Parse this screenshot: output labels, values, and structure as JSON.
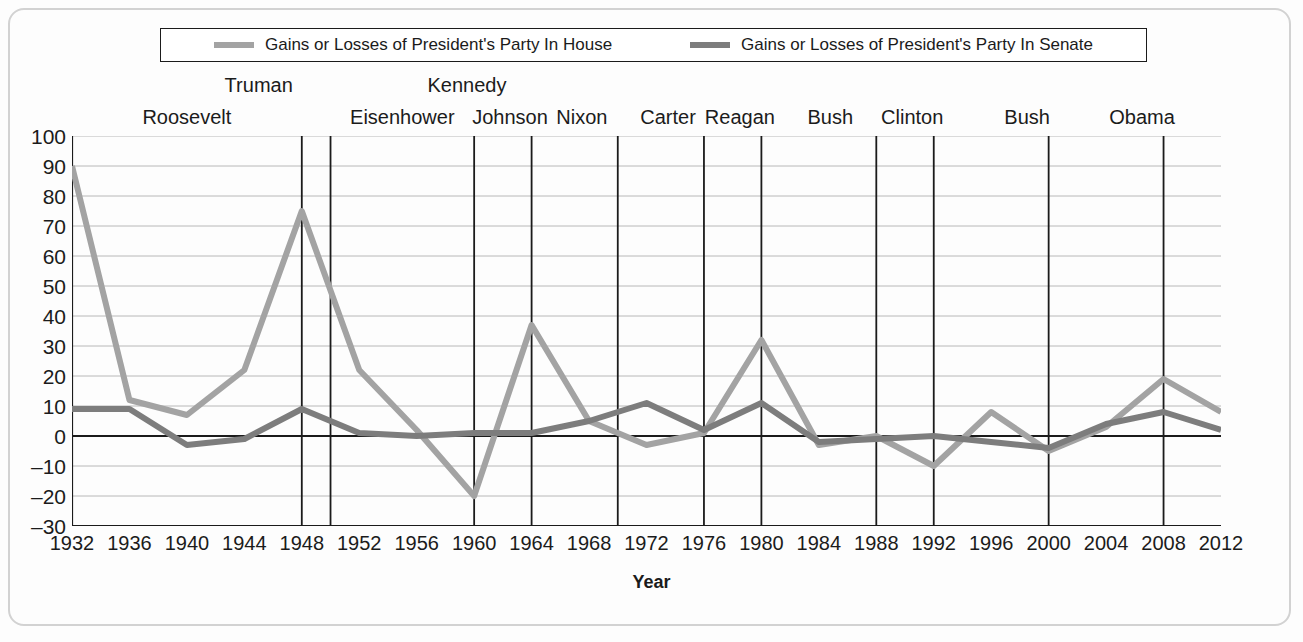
{
  "legend": {
    "entries": [
      {
        "label": "Gains or Losses of President's Party In House",
        "color": "#a3a3a3",
        "series_key": "house"
      },
      {
        "label": "Gains or Losses of President's Party In Senate",
        "color": "#7d7d7d",
        "series_key": "senate"
      }
    ]
  },
  "chart_data": {
    "type": "line",
    "title": "",
    "xlabel": "Year",
    "ylabel": "",
    "grid": true,
    "legend_position": "top",
    "x": [
      1932,
      1936,
      1940,
      1944,
      1948,
      1952,
      1956,
      1960,
      1964,
      1968,
      1972,
      1976,
      1980,
      1984,
      1988,
      1992,
      1996,
      2000,
      2004,
      2008,
      2012
    ],
    "categories": [
      "1932",
      "1936",
      "1940",
      "1944",
      "1948",
      "1952",
      "1956",
      "1960",
      "1964",
      "1968",
      "1972",
      "1976",
      "1980",
      "1984",
      "1988",
      "1992",
      "1996",
      "2000",
      "2004",
      "2008",
      "2012"
    ],
    "xlim": [
      1932,
      2012
    ],
    "ylim": [
      -30,
      100
    ],
    "yticks": [
      100,
      90,
      80,
      70,
      60,
      50,
      40,
      30,
      20,
      10,
      0,
      -10,
      -20,
      -30
    ],
    "ytick_labels": [
      "100",
      "90",
      "80",
      "70",
      "60",
      "50",
      "40",
      "30",
      "20",
      "10",
      "0",
      "–10",
      "–20",
      "–30"
    ],
    "series": [
      {
        "name": "Gains or Losses of President's Party In House",
        "key": "house",
        "color": "#a3a3a3",
        "values": [
          90,
          12,
          7,
          22,
          75,
          22,
          2,
          -20,
          37,
          5,
          -3,
          1,
          32,
          -3,
          0,
          -10,
          8,
          -5,
          3,
          19,
          8
        ]
      },
      {
        "name": "Gains or Losses of President's Party In Senate",
        "key": "senate",
        "color": "#7d7d7d",
        "values": [
          9,
          9,
          -3,
          -1,
          9,
          1,
          0,
          1,
          1,
          5,
          11,
          2,
          11,
          -2,
          -1,
          0,
          -2,
          -4,
          4,
          8,
          2
        ]
      }
    ],
    "annotations": [
      {
        "label": "Roosevelt",
        "year": 1940,
        "row": "lower",
        "divider": null
      },
      {
        "label": "Truman",
        "year": 1945,
        "row": "upper",
        "divider": 1948
      },
      {
        "label": "Eisenhower",
        "year": 1955,
        "row": "lower",
        "divider": 1950
      },
      {
        "label": "Kennedy",
        "year": 1959.5,
        "row": "upper",
        "divider": 1960
      },
      {
        "label": "Johnson",
        "year": 1962.5,
        "row": "lower",
        "divider": 1964
      },
      {
        "label": "Nixon",
        "year": 1967.5,
        "row": "lower",
        "divider": 1970
      },
      {
        "label": "Carter",
        "year": 1973.5,
        "row": "lower",
        "divider": 1976
      },
      {
        "label": "Reagan",
        "year": 1978.5,
        "row": "lower",
        "divider": 1980
      },
      {
        "label": "Bush",
        "year": 1984.8,
        "row": "lower",
        "divider": 1988
      },
      {
        "label": "Clinton",
        "year": 1990.5,
        "row": "lower",
        "divider": 1992
      },
      {
        "label": "Bush",
        "year": 1998.5,
        "row": "lower",
        "divider": 2000
      },
      {
        "label": "Obama",
        "year": 2006.5,
        "row": "lower",
        "divider": 2008
      }
    ]
  },
  "colors": {
    "house_line": "#a3a3a3",
    "senate_line": "#7d7d7d",
    "axis": "#1b1b1b",
    "gridline": "#b8b8b8",
    "divider": "#1b1b1b",
    "frame": "#d2d2d2",
    "background": "#fdfdfd"
  }
}
